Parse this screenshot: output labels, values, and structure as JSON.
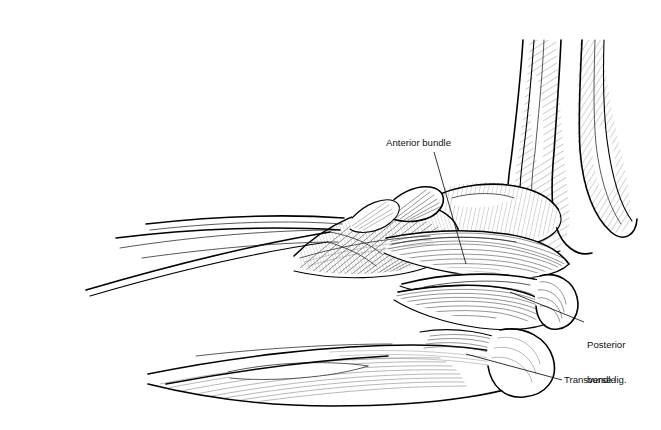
{
  "figure": {
    "number_label": "FIGURE 59–2.",
    "caption": "Anatomy of the medial collateral ligament. The anterior bundle is the primary soft tissue restraint to valgus stress.",
    "background_color": "#ffffff",
    "ink_color": "#000000",
    "illustration_type": "line-art anatomical drawing"
  },
  "annotations": {
    "anterior": {
      "label": "Anterior bundle"
    },
    "posterior": {
      "line1": "Posterior",
      "line2": "bundle"
    },
    "transverse": {
      "label": "Transverse lig."
    }
  }
}
